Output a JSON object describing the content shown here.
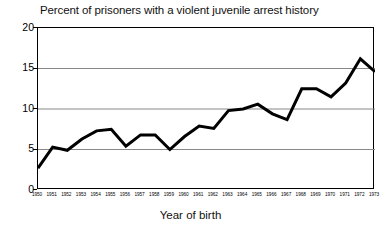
{
  "chart_data": {
    "type": "line",
    "title": "Percent of prisoners with a violent juvenile arrest history",
    "xlabel": "Year of birth",
    "ylabel": "",
    "xlim": [
      1950,
      1973
    ],
    "ylim": [
      0,
      20
    ],
    "ytick_labels": [
      "0",
      "5",
      "10",
      "15",
      "20"
    ],
    "ytick_values": [
      0,
      5,
      10,
      15,
      20
    ],
    "grid": "horizontal",
    "legend": "none",
    "line_color": "#000000",
    "categories": [
      "1950",
      "1951",
      "1952",
      "1953",
      "1954",
      "1955",
      "1956",
      "1957",
      "1958",
      "1959",
      "1960",
      "1961",
      "1962",
      "1963",
      "1964",
      "1965",
      "1966",
      "1967",
      "1968",
      "1969",
      "1970",
      "1971",
      "1972",
      "1973"
    ],
    "values": [
      2.7,
      5.3,
      4.9,
      6.3,
      7.3,
      7.5,
      5.4,
      6.8,
      6.8,
      5.0,
      6.6,
      7.9,
      7.6,
      9.8,
      10.0,
      10.6,
      9.4,
      8.7,
      12.5,
      12.5,
      11.5,
      13.2,
      16.2,
      14.6
    ],
    "series": [
      {
        "name": "Percent with violent juvenile arrest history",
        "values": [
          2.7,
          5.3,
          4.9,
          6.3,
          7.3,
          7.5,
          5.4,
          6.8,
          6.8,
          5.0,
          6.6,
          7.9,
          7.6,
          9.8,
          10.0,
          10.6,
          9.4,
          8.7,
          12.5,
          12.5,
          11.5,
          13.2,
          16.2,
          14.6
        ]
      }
    ]
  }
}
